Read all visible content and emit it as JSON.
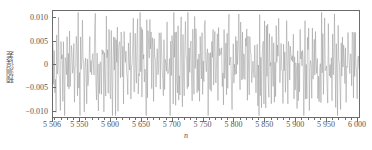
{
  "chart_data": {
    "type": "line",
    "title": "",
    "xlabel": "n",
    "ylabel": "预测误差",
    "xlim": [
      5506,
      6005
    ],
    "ylim": [
      -0.0115,
      0.0115
    ],
    "grid": false,
    "legend": null,
    "series_color": "#8c8c8c",
    "frame_color": "#6b6b6b",
    "xticks": [
      {
        "value": 5506,
        "label": "5 506"
      },
      {
        "value": 5550,
        "label": "5 550"
      },
      {
        "value": 5600,
        "label": "5 600"
      },
      {
        "value": 5650,
        "label": "5 650"
      },
      {
        "value": 5700,
        "label": "5 700"
      },
      {
        "value": 5750,
        "label": "5 750"
      },
      {
        "value": 5800,
        "label": "5 800"
      },
      {
        "value": 5850,
        "label": "5 850"
      },
      {
        "value": 5900,
        "label": "5 900"
      },
      {
        "value": 5950,
        "label": "5 950"
      },
      {
        "value": 6000,
        "label": "6 000"
      }
    ],
    "yticks": [
      {
        "value": 0.01,
        "label": "0.010"
      },
      {
        "value": 0.005,
        "label": "0.005"
      },
      {
        "value": 0.0,
        "label": "0"
      },
      {
        "value": -0.005,
        "label": "-0.005"
      },
      {
        "value": -0.01,
        "label": "-0.010"
      }
    ],
    "series": [
      {
        "name": "prediction-error",
        "description": "Dense zero-mean oscillating prediction error residual sampled at every n from 5506 to 6005, amplitude roughly +/-0.011.",
        "x_start": 5506,
        "x_step": 1,
        "values": [
          0.0065,
          -0.0042,
          0.0081,
          -0.0015,
          0.0033,
          -0.0088,
          0.0052,
          0.0012,
          -0.0061,
          0.0094,
          -0.0035,
          0.0021,
          -0.0077,
          0.0043,
          0.0088,
          -0.0024,
          -0.0056,
          0.0071,
          0.0009,
          -0.0093,
          0.0038,
          0.0062,
          -0.0048,
          0.0015,
          -0.0082,
          0.0099,
          -0.0031,
          0.0054,
          -0.0069,
          0.0027,
          0.0085,
          -0.0011,
          -0.0074,
          0.0046,
          0.0018,
          -0.0097,
          0.0063,
          -0.0039,
          0.0076,
          0.0005,
          -0.0052,
          0.0091,
          -0.0026,
          0.0034,
          -0.0086,
          0.0058,
          0.0013,
          -0.0065,
          0.0102,
          -0.0044,
          0.0022,
          -0.0079,
          0.0049,
          0.0083,
          -0.0017,
          -0.0059,
          0.0068,
          0.0003,
          -0.0105,
          0.0041,
          0.0072,
          -0.0051,
          0.0019,
          -0.0084,
          0.0095,
          -0.0029,
          0.0057,
          -0.0073,
          0.0031,
          0.0079,
          -0.0008,
          -0.0068,
          0.0044,
          0.0024,
          -0.0091,
          0.0066,
          -0.0036,
          0.0074,
          0.0011,
          -0.0055,
          0.0089,
          -0.0021,
          0.0037,
          -0.0081,
          0.0061,
          0.0016,
          -0.0063,
          0.0098,
          -0.0047,
          0.0026,
          -0.0076,
          0.0051,
          0.0086,
          -0.0013,
          -0.0058,
          0.0069,
          0.0007,
          -0.0101,
          0.0039,
          0.0064,
          -0.0049,
          0.0023,
          -0.0087,
          0.0092,
          -0.0033,
          0.0055,
          -0.0071,
          0.0029,
          0.0082,
          -0.0006,
          -0.0066,
          0.0047,
          0.002,
          -0.0094,
          0.006,
          -0.0041,
          0.0077,
          0.0014,
          -0.0053,
          0.009,
          -0.0028,
          0.0036,
          -0.0089,
          0.0059,
          0.001,
          -0.0062,
          0.01,
          -0.0045,
          0.0025,
          -0.0078,
          0.005,
          0.0084,
          -0.0019,
          -0.0057,
          0.007,
          0.0002,
          -0.0103,
          0.0042,
          0.0073,
          -0.005,
          0.0017,
          -0.0085,
          0.0096,
          -0.003,
          0.0056,
          -0.0072,
          0.0032,
          0.008,
          -0.0009,
          -0.0067,
          0.0045,
          0.0028,
          -0.0092,
          0.0065,
          -0.0037,
          0.0075,
          0.0004,
          -0.0054,
          0.0087,
          -0.0023,
          0.0035,
          -0.0083,
          0.0062,
          0.0018,
          -0.0064,
          0.0097,
          -0.0046,
          0.003,
          -0.0075,
          0.0053,
          0.0085,
          -0.0014,
          -0.006,
          0.0067,
          0.0008,
          -0.0099,
          0.004,
          0.0063,
          -0.0048,
          0.0022,
          -0.0086,
          0.0093,
          -0.0034,
          0.0058,
          -0.007,
          0.0027,
          0.0081,
          -0.0005,
          -0.0069,
          0.0048,
          0.0021,
          -0.0095,
          0.0061,
          -0.004,
          0.0078,
          0.0012,
          -0.0051,
          0.0088,
          -0.0027,
          0.0038,
          -0.009,
          0.0057,
          0.0011,
          -0.0061,
          0.0101,
          -0.0043,
          0.0024,
          -0.008,
          0.0052,
          0.0082,
          -0.0018,
          -0.0056,
          0.0071,
          0.0001,
          -0.0104,
          0.0043,
          0.0074,
          -0.0052,
          0.0016,
          -0.0088,
          0.0094,
          -0.0032,
          0.0054,
          -0.0074,
          0.0033,
          0.0079,
          -0.001,
          -0.0065,
          0.0046,
          0.0029,
          -0.0096,
          0.0064,
          -0.0038,
          0.0076,
          0.0006,
          -0.0055,
          0.0086,
          -0.0022,
          0.0034,
          -0.0082,
          0.006,
          0.0019,
          -0.0066,
          0.0098,
          -0.0044,
          0.0031,
          -0.0077,
          0.0049,
          0.0087,
          -0.0016,
          -0.0059,
          0.0068,
          0.0009,
          -0.01,
          0.0041,
          0.0066,
          -0.0047,
          0.0025,
          -0.0084,
          0.0091,
          -0.0035,
          0.0059,
          -0.0068,
          0.0026,
          0.0083,
          -0.0007,
          -0.007,
          0.005,
          0.0023,
          -0.0093,
          0.0062,
          -0.0042,
          0.0077,
          0.0013,
          -0.005,
          0.0089,
          -0.0025,
          0.0039,
          -0.0091,
          0.0056,
          0.0015,
          -0.0063,
          0.0102,
          -0.0041,
          0.0027,
          -0.0079,
          0.0051,
          0.0084,
          -0.002,
          -0.0054,
          0.0072,
          0.0005,
          -0.0106,
          0.0044,
          0.0075,
          -0.0053,
          0.0018,
          -0.0087,
          0.0095,
          -0.0031,
          0.0053,
          -0.0076,
          0.0035,
          0.0078,
          -0.0012,
          -0.0064,
          0.0047,
          0.003,
          -0.0098,
          0.0067,
          -0.0039,
          0.0073,
          0.0008,
          -0.0057,
          0.0085,
          -0.0024,
          0.0036,
          -0.0081,
          0.0058,
          0.002,
          -0.0067,
          0.0099,
          -0.0045,
          0.0032,
          -0.0078,
          0.0048,
          0.0088,
          -0.0015,
          -0.0061,
          0.0069,
          0.001,
          -0.0102,
          0.0042,
          0.0065,
          -0.0049,
          0.0028,
          -0.0085,
          0.009,
          -0.0036,
          0.006,
          -0.0071,
          0.0024,
          0.0086,
          -0.0004,
          -0.0072,
          0.0052,
          0.0026,
          -0.0094,
          0.0063,
          -0.0043,
          0.0079,
          0.0014,
          -0.0049,
          0.0092,
          -0.0029,
          0.004,
          -0.0092,
          0.0055,
          0.0017,
          -0.0062,
          0.0103,
          -0.004,
          0.0029,
          -0.008,
          0.0054,
          0.0081,
          -0.0021,
          -0.0053,
          0.007,
          0.0006,
          -0.0107,
          0.0045,
          0.0076,
          -0.0055,
          0.0019,
          -0.0089,
          0.0097,
          -0.0033,
          0.0051,
          -0.0077,
          0.0037,
          0.008,
          -0.0013,
          -0.0063,
          0.0049,
          0.0031,
          -0.0097,
          0.0068,
          -0.0037,
          0.0072,
          0.0007,
          -0.0058,
          0.0084,
          -0.0026,
          0.0038,
          -0.0083,
          0.0057,
          0.0021,
          -0.0069,
          0.01,
          -0.0046,
          0.0033,
          -0.0075,
          0.005,
          0.0089,
          -0.0017,
          -0.0062,
          0.0071,
          0.0012,
          -0.0101,
          0.0043,
          0.0067,
          -0.0051,
          0.0027,
          -0.0086,
          0.0093,
          -0.0034,
          0.0061,
          -0.0073,
          0.0023,
          0.0087,
          -0.0003,
          -0.0071,
          0.0053,
          0.0025,
          -0.0095,
          0.0064,
          -0.0044,
          0.0078,
          0.0015,
          -0.0048,
          0.0091,
          -0.003,
          0.0041,
          -0.009,
          0.0056,
          0.0016,
          -0.006,
          0.0104,
          -0.0042,
          0.003,
          -0.0082,
          0.0055,
          0.0083,
          -0.0022,
          -0.0052,
          0.0073,
          0.0004,
          -0.0105,
          0.0046,
          0.0077,
          -0.0056,
          0.002,
          -0.0088,
          0.0096,
          -0.0032,
          0.0052,
          -0.0079,
          0.0036,
          0.0082,
          -0.0011,
          -0.0066,
          0.0048,
          0.0032,
          -0.0099,
          0.0069,
          -0.0038,
          0.0074,
          0.0009,
          -0.0059,
          0.0088,
          -0.0027,
          0.0039,
          -0.0084,
          0.0059,
          0.0022,
          -0.007,
          0.0098,
          -0.0047,
          0.0034,
          -0.0074,
          0.0051,
          0.009,
          -0.0018,
          -0.0064,
          0.007,
          0.0013,
          -0.0103,
          0.0044,
          0.0066,
          -0.005,
          0.0026,
          -0.0087,
          0.0094,
          -0.0035,
          0.0062,
          -0.0072,
          0.0025,
          0.0085,
          -0.0002
        ]
      }
    ]
  }
}
